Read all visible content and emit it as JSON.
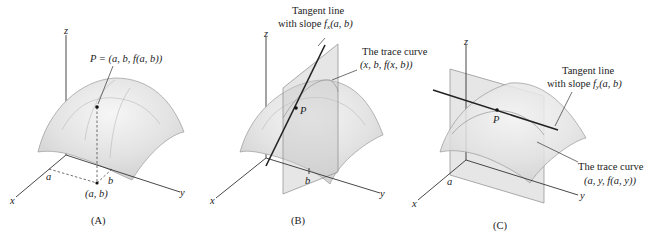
{
  "panels": [
    {
      "id": "A",
      "label": "(A)",
      "axes": {
        "x": "x",
        "y": "y",
        "z": "z"
      },
      "point_label": "P = (a, b, f(a, b))",
      "ticks": {
        "a": "a",
        "b": "b"
      },
      "base_point_label": "(a, b)"
    },
    {
      "id": "B",
      "label": "(B)",
      "axes": {
        "x": "x",
        "y": "y",
        "z": "z"
      },
      "point_label": "P",
      "tangent_label_line1": "Tangent line",
      "tangent_label_line2": "with slope f_x(a, b)",
      "tangent_slope_prefix": "with slope ",
      "tangent_slope_f": "f",
      "tangent_slope_sub": "x",
      "tangent_slope_args": "(a, b)",
      "trace_label_line1": "The trace curve",
      "trace_label_line2": "(x, b, f(x, b))",
      "ticks": {
        "b": "b"
      }
    },
    {
      "id": "C",
      "label": "(C)",
      "axes": {
        "x": "x",
        "y": "y",
        "z": "z"
      },
      "point_label": "P",
      "tangent_label_line1": "Tangent line",
      "tangent_label_line2": "with slope f_y(a, b)",
      "tangent_slope_prefix": "with slope ",
      "tangent_slope_f": "f",
      "tangent_slope_sub": "y",
      "tangent_slope_args": "(a, b)",
      "trace_label_line1": "The trace curve",
      "trace_label_line2": "(a, y, f(a, y))",
      "ticks": {
        "a": "a"
      }
    }
  ]
}
